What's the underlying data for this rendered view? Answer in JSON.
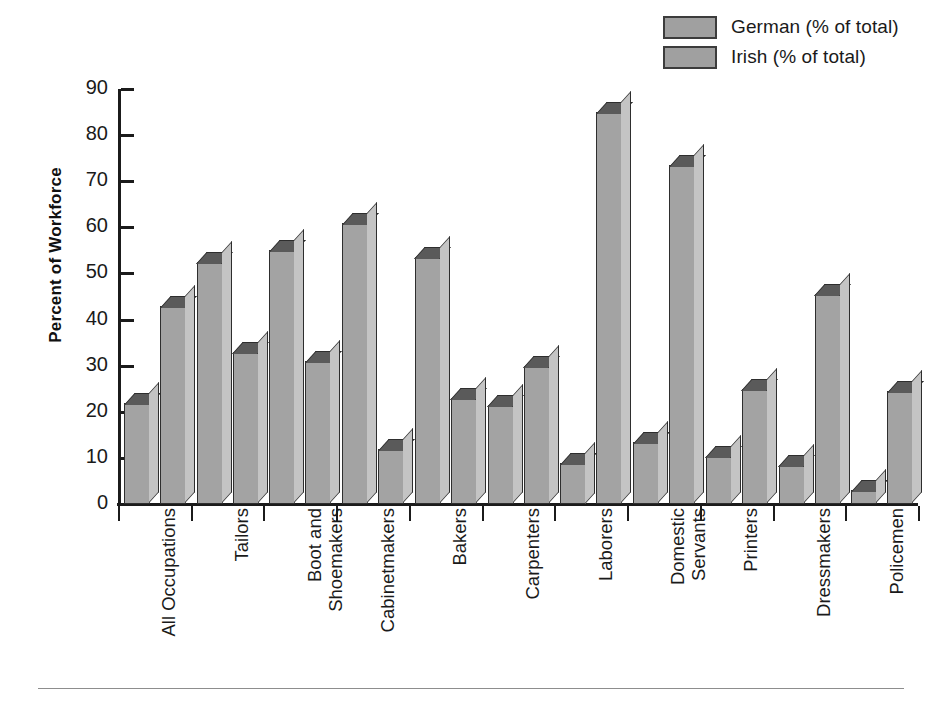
{
  "chart_data": {
    "type": "bar",
    "title": "",
    "xlabel": "",
    "ylabel": "Percent of Workforce",
    "ylim": [
      0,
      90
    ],
    "yticks": [
      0,
      10,
      20,
      30,
      40,
      50,
      60,
      70,
      80,
      90
    ],
    "grid": false,
    "legend_position": "top-right",
    "categories": [
      "All Occupations",
      "Tailors",
      "Boot and\nShoemakers",
      "Cabinetmakers",
      "Bakers",
      "Carpenters",
      "Laborers",
      "Domestic\nServants",
      "Printers",
      "Dressmakers",
      "Policemen"
    ],
    "series": [
      {
        "name": "German (% of total)",
        "color": "#a3a3a3",
        "values": [
          22,
          52.5,
          55,
          61,
          53.5,
          21.5,
          9,
          13.5,
          10.5,
          8.5,
          3
        ]
      },
      {
        "name": "Irish (% of total)",
        "color": "#a3a3a3",
        "values": [
          43,
          33,
          31,
          12,
          23,
          30,
          85,
          73.5,
          25,
          45.5,
          24.5
        ]
      }
    ]
  },
  "legend": {
    "items": [
      {
        "label": "German (% of total)"
      },
      {
        "label": "Irish (% of total)"
      }
    ]
  },
  "axes": {
    "y_title": "Percent of Workforce"
  }
}
